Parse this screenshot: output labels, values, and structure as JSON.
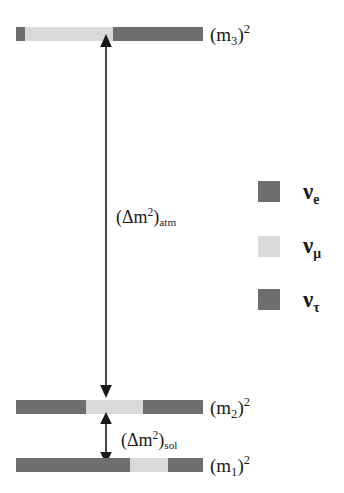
{
  "colors": {
    "nu_e": "#6e6e6e",
    "nu_mu": "#d9d9d9",
    "nu_tau": "#6e6e6e",
    "background": "#ffffff",
    "ink": "#1a1a1a"
  },
  "levels": [
    {
      "id": "m3",
      "label_main": "(m",
      "label_sub": "3",
      "label_close": ")",
      "label_sup": "2",
      "segments": [
        {
          "flavor": "nu_e",
          "width_px": 9
        },
        {
          "flavor": "nu_mu",
          "width_px": 88
        },
        {
          "flavor": "nu_tau",
          "width_px": 90
        }
      ]
    },
    {
      "id": "m2",
      "label_main": "(m",
      "label_sub": "2",
      "label_close": ")",
      "label_sup": "2",
      "segments": [
        {
          "flavor": "nu_e",
          "width_px": 70
        },
        {
          "flavor": "nu_mu",
          "width_px": 57
        },
        {
          "flavor": "nu_tau",
          "width_px": 60
        }
      ]
    },
    {
      "id": "m1",
      "label_main": "(m",
      "label_sub": "1",
      "label_close": ")",
      "label_sup": "2",
      "segments": [
        {
          "flavor": "nu_e",
          "width_px": 114
        },
        {
          "flavor": "nu_mu",
          "width_px": 38
        },
        {
          "flavor": "nu_tau",
          "width_px": 35
        }
      ]
    }
  ],
  "splittings": [
    {
      "id": "atm",
      "open_paren": "(",
      "delta": "Δm",
      "sup": "2",
      "close_paren": ")",
      "sub": "atm"
    },
    {
      "id": "sol",
      "open_paren": "(",
      "delta": "Δm",
      "sup": "2",
      "close_paren": ")",
      "sub": "sol"
    }
  ],
  "legend": [
    {
      "id": "nu_e",
      "symbol": "ν",
      "sub": "e",
      "color": "#6e6e6e"
    },
    {
      "id": "nu_mu",
      "symbol": "ν",
      "sub": "μ",
      "color": "#d9d9d9"
    },
    {
      "id": "nu_tau",
      "symbol": "ν",
      "sub": "τ",
      "color": "#6e6e6e"
    }
  ]
}
